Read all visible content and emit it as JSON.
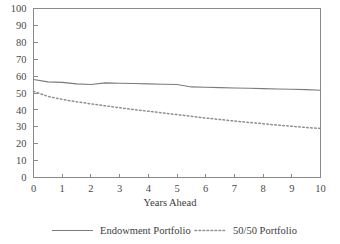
{
  "chart_data": {
    "type": "line",
    "title": "",
    "xlabel": "Years Ahead",
    "ylabel": "",
    "xlim": [
      0,
      10
    ],
    "ylim": [
      0,
      100
    ],
    "grid": false,
    "legend_position": "bottom",
    "x_ticks": [
      "0",
      "1",
      "2",
      "3",
      "4",
      "5",
      "6",
      "7",
      "8",
      "9",
      "10"
    ],
    "y_ticks": [
      "0",
      "10",
      "20",
      "30",
      "40",
      "50",
      "60",
      "70",
      "80",
      "90",
      "100"
    ],
    "x": [
      0,
      0.5,
      1,
      1.5,
      2,
      2.5,
      3,
      3.5,
      4,
      4.5,
      5,
      5.5,
      6,
      6.5,
      7,
      7.5,
      8,
      8.5,
      9,
      9.5,
      10
    ],
    "series": [
      {
        "name": "Endowment Portfolio",
        "style": "solid",
        "color": "#7b7b7b",
        "values": [
          58.0,
          56.6,
          56.3,
          55.4,
          55.0,
          56.0,
          55.8,
          55.6,
          55.4,
          55.2,
          55.0,
          53.6,
          53.4,
          53.2,
          53.0,
          52.8,
          52.6,
          52.4,
          52.2,
          52.0,
          51.6
        ]
      },
      {
        "name": "50/50 Portfolio",
        "style": "dotted",
        "color": "#8f8f8f",
        "values": [
          51.0,
          48.0,
          46.2,
          44.8,
          43.6,
          42.4,
          41.3,
          40.2,
          39.2,
          38.2,
          37.2,
          36.2,
          35.2,
          34.3,
          33.4,
          32.6,
          31.8,
          31.0,
          30.3,
          29.6,
          29.0
        ]
      }
    ]
  },
  "legend": {
    "items": [
      {
        "label": "Endowment Portfolio",
        "style": "solid"
      },
      {
        "label": "50/50 Portfolio",
        "style": "dotted"
      }
    ]
  }
}
